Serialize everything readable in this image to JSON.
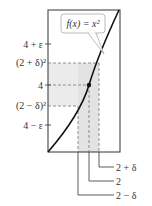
{
  "function_label": "f(x) = x²",
  "y_labels": {
    "four_plus_eps": "4 + ε",
    "two_plus_delta_sq": "(2 + δ)²",
    "four": "4",
    "two_minus_delta_sq": "(2 − δ)²",
    "four_minus_eps": "4 − ε"
  },
  "x_labels": {
    "two_plus_delta": "2 + δ",
    "two": "2",
    "two_minus_delta": "2 − δ"
  },
  "colors": {
    "frame": "#333333",
    "curve": "#111111",
    "shade": "#e6e6e6",
    "dash": "#777777"
  }
}
